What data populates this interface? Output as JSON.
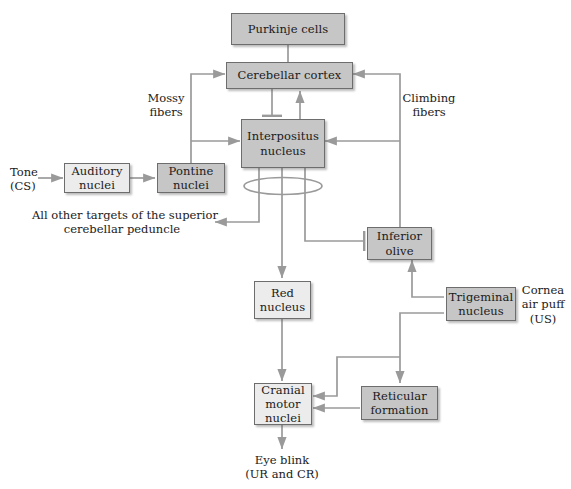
{
  "diagram": {
    "title_text": "",
    "colors": {
      "box_dark": "#c6c6c6",
      "box_light": "#ececec",
      "stroke": "#6d6d6d",
      "connector": "#9a9a9a",
      "text": "#1a1a1a",
      "background": "#ffffff"
    },
    "nodes": [
      {
        "id": "purkinje",
        "label": "Purkinje cells",
        "shade": "dark"
      },
      {
        "id": "cortex",
        "label": "Cerebellar cortex",
        "shade": "dark"
      },
      {
        "id": "interpositus_l1",
        "label": "Interpositus",
        "shade": "dark"
      },
      {
        "id": "interpositus_l2",
        "label": "nucleus",
        "shade": "dark"
      },
      {
        "id": "auditory_l1",
        "label": "Auditory",
        "shade": "light"
      },
      {
        "id": "auditory_l2",
        "label": "nuclei",
        "shade": "light"
      },
      {
        "id": "pontine_l1",
        "label": "Pontine",
        "shade": "dark"
      },
      {
        "id": "pontine_l2",
        "label": "nuclei",
        "shade": "dark"
      },
      {
        "id": "inferior_l1",
        "label": "Inferior",
        "shade": "dark"
      },
      {
        "id": "inferior_l2",
        "label": "olive",
        "shade": "dark"
      },
      {
        "id": "trigeminal_l1",
        "label": "Trigeminal",
        "shade": "dark"
      },
      {
        "id": "trigeminal_l2",
        "label": "nucleus",
        "shade": "dark"
      },
      {
        "id": "red_l1",
        "label": "Red",
        "shade": "light"
      },
      {
        "id": "red_l2",
        "label": "nucleus",
        "shade": "light"
      },
      {
        "id": "cranial_l1",
        "label": "Cranial",
        "shade": "light"
      },
      {
        "id": "cranial_l2",
        "label": "motor",
        "shade": "light"
      },
      {
        "id": "cranial_l3",
        "label": "nuclei",
        "shade": "light"
      },
      {
        "id": "reticular_l1",
        "label": "Reticular",
        "shade": "dark"
      },
      {
        "id": "reticular_l2",
        "label": "formation",
        "shade": "dark"
      }
    ],
    "boxes": {
      "purkinje": {
        "label": "Purkinje cells"
      },
      "cortex": {
        "label": "Cerebellar cortex"
      },
      "interpositus": {
        "line1": "Interpositus",
        "line2": "nucleus"
      },
      "auditory": {
        "line1": "Auditory",
        "line2": "nuclei"
      },
      "pontine": {
        "line1": "Pontine",
        "line2": "nuclei"
      },
      "inferior_olive": {
        "line1": "Inferior",
        "line2": "olive"
      },
      "trigeminal": {
        "line1": "Trigeminal",
        "line2": "nucleus"
      },
      "red_nucleus": {
        "line1": "Red",
        "line2": "nucleus"
      },
      "cranial": {
        "line1": "Cranial",
        "line2": "motor",
        "line3": "nuclei"
      },
      "reticular": {
        "line1": "Reticular",
        "line2": "formation"
      }
    },
    "labels": {
      "tone": {
        "line1": "Tone",
        "line2": "(CS)"
      },
      "mossy": {
        "line1": "Mossy",
        "line2": "fibers"
      },
      "climbing": {
        "line1": "Climbing",
        "line2": "fibers"
      },
      "other_targets": {
        "line1": "All other targets of the superior",
        "line2": "cerebellar peduncle"
      },
      "cornea": {
        "line1": "Cornea",
        "line2": "air puff",
        "line3": "(US)"
      },
      "eye_blink": {
        "line1": "Eye blink",
        "line2": "(UR and CR)"
      }
    },
    "connections": [
      {
        "from": "purkinje",
        "to": "cortex",
        "type": "plain"
      },
      {
        "from": "cortex",
        "to": "interpositus",
        "type": "inhibitory"
      },
      {
        "from": "interpositus",
        "to": "cortex",
        "type": "excitatory"
      },
      {
        "from": "tone",
        "to": "auditory",
        "type": "excitatory"
      },
      {
        "from": "auditory",
        "to": "pontine",
        "type": "excitatory"
      },
      {
        "from": "pontine",
        "to": "cortex",
        "type": "excitatory",
        "via": "mossy fibers"
      },
      {
        "from": "pontine",
        "to": "interpositus",
        "type": "excitatory",
        "via": "mossy fibers"
      },
      {
        "from": "inferior_olive",
        "to": "cortex",
        "type": "excitatory",
        "via": "climbing fibers"
      },
      {
        "from": "inferior_olive",
        "to": "interpositus",
        "type": "excitatory",
        "via": "climbing fibers"
      },
      {
        "from": "interpositus",
        "to": "other_targets",
        "type": "excitatory"
      },
      {
        "from": "interpositus",
        "to": "red_nucleus",
        "type": "excitatory"
      },
      {
        "from": "interpositus",
        "to": "inferior_olive",
        "type": "inhibitory"
      },
      {
        "from": "trigeminal",
        "to": "inferior_olive",
        "type": "excitatory"
      },
      {
        "from": "trigeminal",
        "to": "cranial",
        "type": "excitatory"
      },
      {
        "from": "red_nucleus",
        "to": "cranial",
        "type": "excitatory"
      },
      {
        "from": "reticular",
        "to": "cranial",
        "type": "excitatory"
      },
      {
        "from": "reticular_path_up",
        "to": "reticular",
        "type": "excitatory"
      },
      {
        "from": "cranial",
        "to": "eye_blink",
        "type": "excitatory"
      }
    ]
  }
}
